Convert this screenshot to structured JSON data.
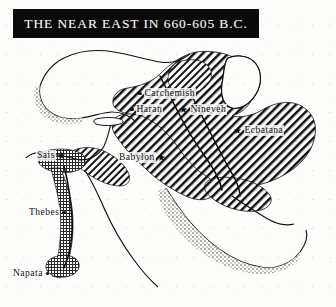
{
  "figure": {
    "kind": "historical-map-engraving",
    "width": 336,
    "height": 307,
    "paper_color": "#fdfdfc",
    "ink_color": "#101010"
  },
  "title_banner": {
    "text": "THE NEAR EAST IN 660-605 B.C.",
    "background_color": "#0a0a0a",
    "text_color": "#f4f1ea"
  },
  "cities": [
    {
      "name": "Carchemish",
      "marker": "dot",
      "marker_side": "left",
      "x": 136,
      "y": 88
    },
    {
      "name": "Haran",
      "marker": "dot",
      "marker_side": "left",
      "x": 128,
      "y": 104
    },
    {
      "name": "Nineveh",
      "marker": "star",
      "marker_side": "left",
      "x": 178,
      "y": 104
    },
    {
      "name": "Ecbatana",
      "marker": "star",
      "marker_side": "left",
      "x": 232,
      "y": 125
    },
    {
      "name": "Babylon",
      "marker": "star",
      "marker_side": "right",
      "x": 118,
      "y": 152
    },
    {
      "name": "Sais",
      "marker": "star",
      "marker_side": "right",
      "x": 36,
      "y": 150
    },
    {
      "name": "Thebes",
      "marker": "dot",
      "marker_side": "right",
      "x": 28,
      "y": 207
    },
    {
      "name": "Napata",
      "marker": "dot",
      "marker_side": "right",
      "x": 12,
      "y": 268
    }
  ],
  "regions": [
    {
      "name": "Median and Babylonian empire",
      "fill_pattern": "diagonal-hatch"
    },
    {
      "name": "Egypt and Kush (Nile valley)",
      "fill_pattern": "cross-hatch-stipple"
    }
  ],
  "water_bodies": [
    "Black Sea",
    "Mediterranean Sea",
    "Caspian Sea",
    "Red Sea",
    "Persian Gulf"
  ],
  "islands": [
    "Cyprus"
  ],
  "rivers": [
    "Nile",
    "Euphrates",
    "Tigris"
  ]
}
